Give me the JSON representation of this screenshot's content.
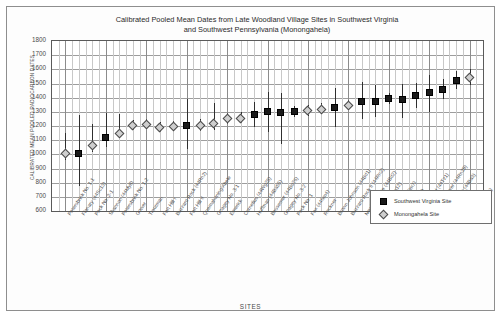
{
  "chart_data": {
    "type": "scatter",
    "title": "Calibrated Pooled Mean Dates from Late Woodland Village Sites in Southwest Virginia and Southwest Pennsylvania (Monongahela)",
    "title_line1": "Calibrated Pooled Mean Dates from Late Woodland Village Sites in Southwest Virginia",
    "title_line2": "and Southwest Pennsylvania (Monongahela)",
    "xlabel": "SITES",
    "ylabel": "CALIBRATED MEAN POOLED RADIOCARBON DATES",
    "ylim": [
      600,
      1800
    ],
    "ytick_step": 100,
    "yticks": [
      1800,
      1700,
      1600,
      1500,
      1400,
      1300,
      1200,
      1100,
      1000,
      900,
      800,
      700,
      600
    ],
    "grid": true,
    "legend_position": "bottom-right",
    "series": [
      {
        "name": "Southwest Virginia Site",
        "marker": "square",
        "color": "#1a1a1a"
      },
      {
        "name": "Monongahela Site",
        "marker": "diamond",
        "color": "#cfcfcf"
      }
    ],
    "categories": [
      "Petersbrink No. 1-1",
      "Flanary (44Sc13)",
      "Peck No. 2-1",
      "Shannon (44My8)",
      "Petersbrink No. 1-2",
      "Gower",
      "Troutman",
      "Fort Hill I",
      "Buzzard Rock (44Rn2)",
      "Fort Hill II",
      "Quemahoning/Abele",
      "Gnagey No. 3-1",
      "Emerick",
      "Cornelius (44Wg25)",
      "Huffman (44Ba55)",
      "Bessemer (44Bo26)",
      "Gnagey No. 3-2",
      "Peck No. 1",
      "Fox (44Sm4)",
      "Reckner",
      "Brown Johnson (44Bd1)",
      "Buzzard Rock II (44Rn2)",
      "Newberry Tate (44Bd2)",
      "Sullins (44Wg12)",
      "Bonham (44Sm7)",
      "Hoge (44Tz6)",
      "Crab Orchard (44Tz1)",
      "Thomas Sawyer (44Rn39)",
      "Perkins Point (44Ba3)",
      "Peck No. 2-2",
      "Trigg (44My3)"
    ],
    "points": [
      {
        "site": "Petersbrink No. 1-1",
        "group": "Monongahela Site",
        "value": 1005,
        "low": 960,
        "high": 1150
      },
      {
        "site": "Flanary (44Sc13)",
        "group": "Southwest Virginia Site",
        "value": 1005,
        "low": 780,
        "high": 1275
      },
      {
        "site": "Peck No. 2-1",
        "group": "Monongahela Site",
        "value": 1060,
        "low": 1020,
        "high": 1215
      },
      {
        "site": "Shannon (44My8)",
        "group": "Southwest Virginia Site",
        "value": 1120,
        "low": 1055,
        "high": 1290
      },
      {
        "site": "Petersbrink No. 1-2",
        "group": "Monongahela Site",
        "value": 1150,
        "low": 1115,
        "high": 1285
      },
      {
        "site": "Gower",
        "group": "Monongahela Site",
        "value": 1205,
        "low": 1175,
        "high": 1245
      },
      {
        "site": "Troutman",
        "group": "Monongahela Site",
        "value": 1210,
        "low": 1180,
        "high": 1250
      },
      {
        "site": "Fort Hill I",
        "group": "Monongahela Site",
        "value": 1190,
        "low": 1160,
        "high": 1230
      },
      {
        "site": "Buzzard Rock (44Rn2)",
        "group": "Monongahela Site",
        "value": 1195,
        "low": 1165,
        "high": 1235
      },
      {
        "site": "Fort Hill II",
        "group": "Southwest Virginia Site",
        "value": 1205,
        "low": 1040,
        "high": 1390
      },
      {
        "site": "Quemahoning/Abele",
        "group": "Monongahela Site",
        "value": 1205,
        "low": 1165,
        "high": 1250
      },
      {
        "site": "Gnagey No. 3-1",
        "group": "Monongahela Site",
        "value": 1215,
        "low": 1170,
        "high": 1360
      },
      {
        "site": "Emerick",
        "group": "Monongahela Site",
        "value": 1250,
        "low": 1215,
        "high": 1290
      },
      {
        "site": "Cornelius (44Wg25)",
        "group": "Monongahela Site",
        "value": 1255,
        "low": 1220,
        "high": 1300
      },
      {
        "site": "Huffman (44Ba55)",
        "group": "Southwest Virginia Site",
        "value": 1280,
        "low": 1190,
        "high": 1370
      },
      {
        "site": "Bessemer (44Bo26)",
        "group": "Southwest Virginia Site",
        "value": 1300,
        "low": 1160,
        "high": 1440
      },
      {
        "site": "Gnagey No. 3-2",
        "group": "Southwest Virginia Site",
        "value": 1295,
        "low": 1075,
        "high": 1430
      },
      {
        "site": "Peck No. 1",
        "group": "Southwest Virginia Site",
        "value": 1300,
        "low": 1265,
        "high": 1340
      },
      {
        "site": "Fox (44Sm4)",
        "group": "Monongahela Site",
        "value": 1310,
        "low": 1270,
        "high": 1350
      },
      {
        "site": "Reckner",
        "group": "Monongahela Site",
        "value": 1320,
        "low": 1285,
        "high": 1360
      },
      {
        "site": "Brown Johnson (44Bd1)",
        "group": "Southwest Virginia Site",
        "value": 1330,
        "low": 1195,
        "high": 1470
      },
      {
        "site": "Buzzard Rock II (44Rn2)",
        "group": "Monongahela Site",
        "value": 1345,
        "low": 1310,
        "high": 1385
      },
      {
        "site": "Newberry Tate (44Bd2)",
        "group": "Southwest Virginia Site",
        "value": 1375,
        "low": 1250,
        "high": 1510
      },
      {
        "site": "Sullins (44Wg12)",
        "group": "Southwest Virginia Site",
        "value": 1370,
        "low": 1260,
        "high": 1490
      },
      {
        "site": "Bonham (44Sm7)",
        "group": "Southwest Virginia Site",
        "value": 1395,
        "low": 1355,
        "high": 1430
      },
      {
        "site": "Hoge (44Tz6)",
        "group": "Southwest Virginia Site",
        "value": 1385,
        "low": 1255,
        "high": 1500
      },
      {
        "site": "Crab Orchard (44Tz1)",
        "group": "Southwest Virginia Site",
        "value": 1415,
        "low": 1330,
        "high": 1505
      },
      {
        "site": "Thomas Sawyer (44Rn39)",
        "group": "Southwest Virginia Site",
        "value": 1440,
        "low": 1300,
        "high": 1560
      },
      {
        "site": "Perkins Point (44Ba3)",
        "group": "Southwest Virginia Site",
        "value": 1460,
        "low": 1390,
        "high": 1535
      },
      {
        "site": "Peck No. 2-2",
        "group": "Southwest Virginia Site",
        "value": 1520,
        "low": 1460,
        "high": 1585
      },
      {
        "site": "Trigg (44My3)",
        "group": "Monongahela Site",
        "value": 1545,
        "low": 1490,
        "high": 1600
      }
    ]
  }
}
